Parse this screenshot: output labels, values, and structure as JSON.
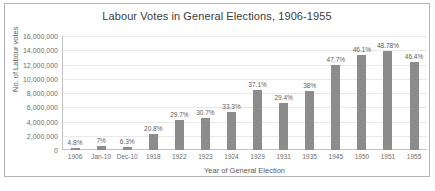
{
  "chart_data": {
    "type": "bar",
    "title": "Labour Votes in General Elections, 1906-1955",
    "xlabel": "Year of General Election",
    "ylabel": "No. of Labour votes",
    "ylim": [
      0,
      16000000
    ],
    "ytick_labels": [
      "16,000,000",
      "14,000,000",
      "12,000,000",
      "10,000,000",
      "8,000,000",
      "6,000,000",
      "4,000,000",
      "2,000,000",
      "0"
    ],
    "ytick_values": [
      16000000,
      14000000,
      12000000,
      10000000,
      8000000,
      6000000,
      4000000,
      2000000,
      0
    ],
    "grid": true,
    "legend": false,
    "categories": [
      "1906",
      "Jan-10",
      "Dec-10",
      "1918",
      "1922",
      "1923",
      "1924",
      "1929",
      "1931",
      "1935",
      "1945",
      "1950",
      "1951",
      "1955"
    ],
    "values": [
      330000,
      505000,
      371000,
      2245000,
      4237000,
      4439000,
      5281000,
      8370000,
      6650000,
      8325000,
      11970000,
      13270000,
      13950000,
      12400000
    ],
    "data_labels": [
      "4.8%",
      "7%",
      "6.3%",
      "20.8%",
      "29.7%",
      "30.7%",
      "33.3%",
      "37.1%",
      "29.4%",
      "38%",
      "47.7%",
      "46.1%",
      "48.78%",
      "46.4%"
    ],
    "bar_color": "#8c8c8c",
    "background_color": "#ffffff",
    "border_color": "#b4b4b4"
  }
}
